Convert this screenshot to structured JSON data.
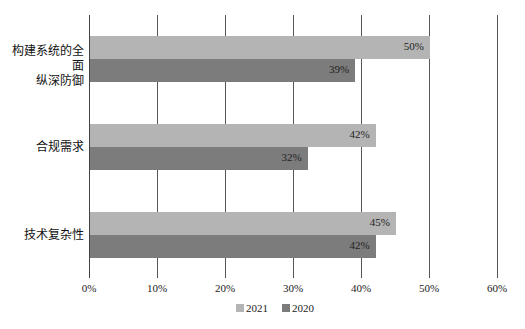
{
  "chart_data": {
    "type": "bar",
    "orientation": "horizontal",
    "categories": [
      "构建系统的全面纵深防御",
      "合规需求",
      "技术复杂性"
    ],
    "category_label_lines": [
      [
        "构建系统的全面",
        "纵深防御"
      ],
      [
        "合规需求"
      ],
      [
        "技术复杂性"
      ]
    ],
    "series": [
      {
        "name": "2021",
        "values": [
          50,
          42,
          45
        ],
        "labels": [
          "50%",
          "42%",
          "45%"
        ],
        "color": "#b4b4b4"
      },
      {
        "name": "2020",
        "values": [
          39,
          32,
          42
        ],
        "labels": [
          "39%",
          "32%",
          "42%"
        ],
        "color": "#7c7c7c"
      }
    ],
    "xlabel": "",
    "ylabel": "",
    "xlim": [
      0,
      60
    ],
    "x_ticks": [
      "0%",
      "10%",
      "20%",
      "30%",
      "40%",
      "50%",
      "60%"
    ],
    "grid": true,
    "legend_position": "bottom",
    "title": ""
  },
  "legend": {
    "items": [
      {
        "label": "2021",
        "color": "#b4b4b4"
      },
      {
        "label": "2020",
        "color": "#7c7c7c"
      }
    ]
  }
}
